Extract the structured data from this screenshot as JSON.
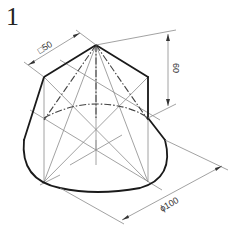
{
  "figure": {
    "number": "1"
  },
  "dimensions": {
    "square_side": "□50",
    "height": "60",
    "base_diameter": "ϕ100"
  },
  "colors": {
    "outline": "#1a1a1a",
    "construction": "#8a8a8a",
    "background": "#ffffff"
  }
}
